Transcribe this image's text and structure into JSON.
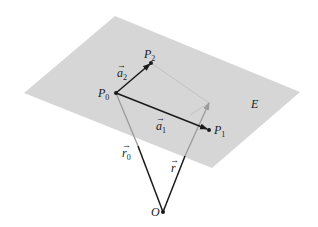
{
  "diagram": {
    "type": "vector plane representation",
    "plane": {
      "label": "E",
      "color": "#d6d6d6"
    },
    "points": [
      {
        "id": "P0",
        "name": "P",
        "sub": "0"
      },
      {
        "id": "P1",
        "name": "P",
        "sub": "1"
      },
      {
        "id": "P2",
        "name": "P",
        "sub": "2"
      },
      {
        "id": "O",
        "name": "O",
        "sub": ""
      }
    ],
    "vectors": [
      {
        "id": "a1",
        "name": "a",
        "sub": "1",
        "from": "P0",
        "to": "P1",
        "color": "#1a1a1a"
      },
      {
        "id": "a2",
        "name": "a",
        "sub": "2",
        "from": "P0",
        "to": "P2",
        "color": "#1a1a1a"
      },
      {
        "id": "r0",
        "name": "r",
        "sub": "0",
        "from": "O",
        "to": "P0",
        "color": "#1a1a1a"
      },
      {
        "id": "r",
        "name": "r",
        "sub": "",
        "from": "O",
        "to": "X",
        "color": "#1a1a1a"
      }
    ],
    "hidden_color": "#9a9a9a"
  }
}
